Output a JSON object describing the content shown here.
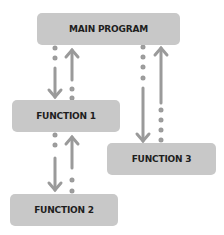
{
  "diagram": {
    "nodes": [
      {
        "id": "main",
        "label": "MAIN PROGRAM"
      },
      {
        "id": "f1",
        "label": "FUNCTION 1"
      },
      {
        "id": "f2",
        "label": "FUNCTION 2"
      },
      {
        "id": "f3",
        "label": "FUNCTION 3"
      }
    ],
    "edges": [
      {
        "from": "main",
        "to": "f1",
        "type": "call"
      },
      {
        "from": "f1",
        "to": "main",
        "type": "return"
      },
      {
        "from": "f1",
        "to": "f2",
        "type": "call"
      },
      {
        "from": "f2",
        "to": "f1",
        "type": "return"
      },
      {
        "from": "main",
        "to": "f3",
        "type": "call"
      },
      {
        "from": "f3",
        "to": "main",
        "type": "return"
      }
    ],
    "colors": {
      "box": "#c8c8c8",
      "arrow": "#9a9a9a",
      "text": "#1e1e1e"
    }
  }
}
